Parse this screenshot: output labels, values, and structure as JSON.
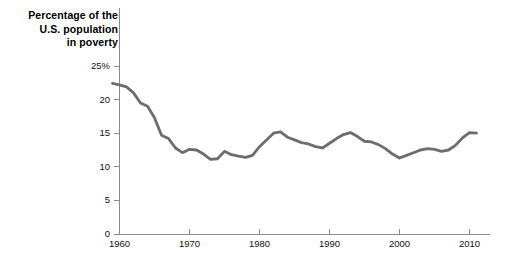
{
  "chart_data": {
    "type": "line",
    "title": "Percentage of the U.S. population in poverty",
    "title_lines": [
      "Percentage of the",
      "U.S. population",
      "in poverty"
    ],
    "xlabel": "",
    "ylabel": "",
    "xlim": [
      1959,
      2011
    ],
    "ylim": [
      0,
      25
    ],
    "grid": false,
    "legend": "none",
    "line_color": "#6d6d6d",
    "axis_color": "#8a8a8a",
    "text_color": "#111111",
    "x_ticks": [
      1960,
      1970,
      1980,
      1990,
      2000,
      2010
    ],
    "x_tick_labels": [
      "1960",
      "1970",
      "1980",
      "1990",
      "2000",
      "2010"
    ],
    "y_ticks": [
      0,
      5,
      10,
      15,
      20,
      25
    ],
    "y_tick_labels": [
      "0",
      "5",
      "10",
      "15",
      "20",
      "25%"
    ],
    "series": [
      {
        "name": "U.S. poverty rate",
        "x": [
          1959,
          1960,
          1961,
          1962,
          1963,
          1964,
          1965,
          1966,
          1967,
          1968,
          1969,
          1970,
          1971,
          1972,
          1973,
          1974,
          1975,
          1976,
          1977,
          1978,
          1979,
          1980,
          1981,
          1982,
          1983,
          1984,
          1985,
          1986,
          1987,
          1988,
          1989,
          1990,
          1991,
          1992,
          1993,
          1994,
          1995,
          1996,
          1997,
          1998,
          1999,
          2000,
          2001,
          2002,
          2003,
          2004,
          2005,
          2006,
          2007,
          2008,
          2009,
          2010,
          2011
        ],
        "values": [
          22.4,
          22.2,
          21.9,
          21.0,
          19.5,
          19.0,
          17.3,
          14.7,
          14.2,
          12.8,
          12.1,
          12.6,
          12.5,
          11.9,
          11.1,
          11.2,
          12.3,
          11.8,
          11.6,
          11.4,
          11.7,
          13.0,
          14.0,
          15.0,
          15.2,
          14.4,
          14.0,
          13.6,
          13.4,
          13.0,
          12.8,
          13.5,
          14.2,
          14.8,
          15.1,
          14.5,
          13.8,
          13.7,
          13.3,
          12.7,
          11.9,
          11.3,
          11.7,
          12.1,
          12.5,
          12.7,
          12.6,
          12.3,
          12.5,
          13.2,
          14.3,
          15.1,
          15.0
        ]
      }
    ]
  }
}
